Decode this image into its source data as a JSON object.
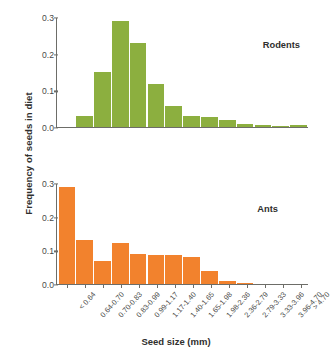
{
  "chart_data": {
    "type": "bar",
    "title": "",
    "xlabel": "Seed size (mm)",
    "ylabel": "Frequency of seeds in diet",
    "ylim": [
      0.0,
      0.3
    ],
    "yticks": [
      "0.0",
      "0.1",
      "0.2",
      "0.3"
    ],
    "ytick_values": [
      0.0,
      0.1,
      0.2,
      0.3
    ],
    "grid": false,
    "legend_position": "inside-panel-right",
    "categories": [
      "< 0.64",
      "0.64-0.70",
      "0.70-0.83",
      "0.83-0.99",
      "0.99-1.17",
      "1.17-1.40",
      "1.40-1.65",
      "1.65-1.98",
      "1.98-2.36",
      "2.36-2.79",
      "2.79-3.33",
      "3.33-3.96",
      "3.96-4.70",
      "> 4.70"
    ],
    "panels": [
      {
        "name": "Rodents",
        "label": "Rodents",
        "color": "#8CAF3F",
        "values": [
          0.0,
          0.03,
          0.15,
          0.29,
          0.23,
          0.118,
          0.057,
          0.029,
          0.028,
          0.019,
          0.007,
          0.006,
          0.004,
          0.005
        ]
      },
      {
        "name": "Ants",
        "label": "Ants",
        "color": "#F2822D",
        "values": [
          0.288,
          0.131,
          0.068,
          0.121,
          0.088,
          0.087,
          0.087,
          0.081,
          0.039,
          0.008,
          0.003,
          0.0,
          0.0,
          0.0
        ]
      }
    ]
  },
  "colors": {
    "rodents": "#8CAF3F",
    "ants": "#F2822D",
    "axis": "#6d6d68",
    "text": "#2f2f2d",
    "background": "#ffffff"
  }
}
